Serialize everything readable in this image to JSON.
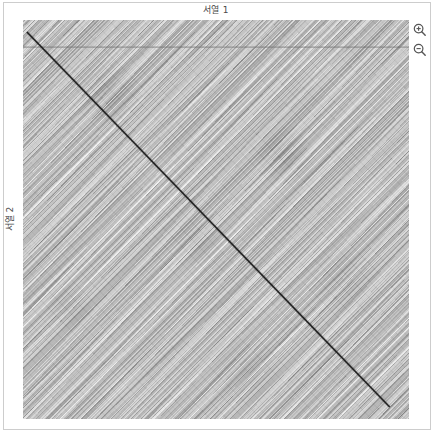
{
  "window": {
    "background": "#ffffff",
    "border_color": "#cdcdcd"
  },
  "plot": {
    "x_axis_title": "서열 1",
    "y_axis_title": "서열 2",
    "background_color": "#b4b4b4",
    "diagonal_color": "#1a1a1a",
    "guide_line_color": "#707070",
    "label_color": "#4a4a4a"
  },
  "controls": {
    "zoom_in": {
      "icon": "magnifier-plus-icon",
      "label": "확대"
    },
    "zoom_out": {
      "icon": "magnifier-minus-icon",
      "label": "축소"
    }
  },
  "chart_data": {
    "type": "heatmap",
    "title": "",
    "xlabel": "서열 1",
    "ylabel": "서열 2",
    "grid": false,
    "legend": false,
    "xlim": [
      0,
      1
    ],
    "ylim": [
      0,
      1
    ],
    "xticks": [],
    "yticks": [],
    "features": [
      {
        "name": "main-diagonal",
        "kind": "line",
        "x": [
          0.01,
          0.95
        ],
        "y": [
          0.03,
          0.97
        ],
        "color": "#1a1a1a",
        "width": 1.4
      },
      {
        "name": "horizontal-guide-line",
        "kind": "line",
        "x": [
          0.0,
          1.0
        ],
        "y": [
          0.068,
          0.068
        ],
        "color": "#707070",
        "width": 0.8
      }
    ],
    "noise": {
      "orientation_deg": 135,
      "value_min": 0.35,
      "value_max": 0.85,
      "colormap": "greys"
    }
  }
}
